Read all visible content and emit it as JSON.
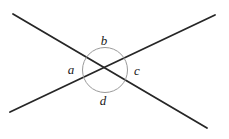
{
  "figure": {
    "type": "geometry-diagram",
    "width": 229,
    "height": 139,
    "background_color": "#ffffff"
  },
  "colors": {
    "line_stroke": "#262626",
    "circle_stroke": "#9a9a9a",
    "label_text": "#1a1a1a",
    "background": "#ffffff"
  },
  "geometry": {
    "intersection": {
      "x": 105,
      "y": 70
    },
    "lines": [
      {
        "name": "descending-line",
        "x1": 13,
        "y1": 14,
        "x2": 207,
        "y2": 128,
        "stroke_width": 1.8
      },
      {
        "name": "ascending-line",
        "x1": 10,
        "y1": 112,
        "x2": 215,
        "y2": 15,
        "stroke_width": 1.8
      }
    ],
    "circle": {
      "cx": 105,
      "cy": 70,
      "r": 22.5,
      "stroke_width": 1
    }
  },
  "labels": [
    {
      "id": "label-b",
      "text": "b",
      "x": 104,
      "y": 40,
      "position": "top"
    },
    {
      "id": "label-a",
      "text": "a",
      "x": 71,
      "y": 69,
      "position": "left"
    },
    {
      "id": "label-c",
      "text": "c",
      "x": 137,
      "y": 70,
      "position": "right"
    },
    {
      "id": "label-d",
      "text": "d",
      "x": 103,
      "y": 100,
      "position": "bottom"
    }
  ]
}
